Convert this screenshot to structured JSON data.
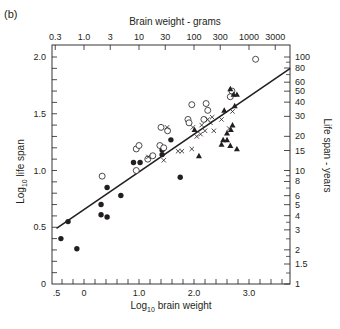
{
  "panel_label": "(b)",
  "chart_data": {
    "type": "scatter",
    "title": "",
    "xlabel": "Log10 brain weight",
    "ylabel": "Log10 life span",
    "x2label": "Brain weight - grams",
    "y2label": "Life span - years",
    "xlim": [
      -0.5,
      3.75
    ],
    "ylim": [
      0,
      2.1
    ],
    "grid": false,
    "legend": "none",
    "x_ticks": [
      {
        "value": -0.5,
        "label": ".5"
      },
      {
        "value": 0,
        "label": "0"
      },
      {
        "value": 1.0,
        "label": "1.0"
      },
      {
        "value": 2.0,
        "label": "2.0"
      },
      {
        "value": 3.0,
        "label": "3.0"
      }
    ],
    "y_ticks": [
      {
        "value": 0,
        "label": "0"
      },
      {
        "value": 0.5,
        "label": "0.5"
      },
      {
        "value": 1.0,
        "label": "1.0"
      },
      {
        "value": 1.5,
        "label": "1.5"
      },
      {
        "value": 2.0,
        "label": "2.0"
      }
    ],
    "top_ticks": [
      {
        "grams": 0.3,
        "label": "0.3"
      },
      {
        "grams": 1.0,
        "label": "1.0"
      },
      {
        "grams": 3,
        "label": "3"
      },
      {
        "grams": 10,
        "label": "10"
      },
      {
        "grams": 30,
        "label": "30"
      },
      {
        "grams": 100,
        "label": "100"
      },
      {
        "grams": 300,
        "label": "300"
      },
      {
        "grams": 1000,
        "label": "1000"
      },
      {
        "grams": 3000,
        "label": "3000"
      }
    ],
    "right_ticks": [
      {
        "years": 100,
        "label": "100"
      },
      {
        "years": 80,
        "label": "80"
      },
      {
        "years": 60,
        "label": "60"
      },
      {
        "years": 50,
        "label": "50"
      },
      {
        "years": 40,
        "label": "40"
      },
      {
        "years": 30,
        "label": "30"
      },
      {
        "years": 20,
        "label": "20"
      },
      {
        "years": 15,
        "label": "15"
      },
      {
        "years": 10,
        "label": "10"
      },
      {
        "years": 8,
        "label": "8"
      },
      {
        "years": 6,
        "label": "6"
      },
      {
        "years": 5,
        "label": "5"
      },
      {
        "years": 4,
        "label": "4"
      },
      {
        "years": 3,
        "label": "3"
      },
      {
        "years": 2,
        "label": "2"
      },
      {
        "years": 1.5,
        "label": "1.5"
      },
      {
        "years": 1,
        "label": "1"
      }
    ],
    "regression_line": {
      "x": [
        -0.5,
        3.75
      ],
      "y": [
        0.49,
        1.9
      ]
    },
    "series": [
      {
        "name": "filled-circle",
        "marker": "filled-circle",
        "points": [
          [
            -0.42,
            0.4
          ],
          [
            -0.29,
            0.55
          ],
          [
            -0.13,
            0.31
          ],
          [
            0.31,
            0.61
          ],
          [
            0.31,
            0.7
          ],
          [
            0.42,
            0.85
          ],
          [
            0.42,
            0.59
          ],
          [
            0.67,
            0.78
          ],
          [
            0.9,
            1.07
          ],
          [
            1.02,
            1.07
          ],
          [
            1.42,
            1.18
          ],
          [
            1.58,
            1.27
          ],
          [
            1.75,
            0.94
          ],
          [
            1.42,
            1.14
          ]
        ]
      },
      {
        "name": "open-circle",
        "marker": "open-circle",
        "points": [
          [
            0.33,
            0.95
          ],
          [
            0.95,
            1.19
          ],
          [
            0.95,
            1.0
          ],
          [
            1.16,
            1.1
          ],
          [
            1.25,
            1.13
          ],
          [
            1.4,
            1.38
          ],
          [
            1.38,
            1.22
          ],
          [
            1.45,
            1.2
          ],
          [
            1.89,
            1.45
          ],
          [
            1.96,
            1.58
          ],
          [
            1.91,
            1.42
          ],
          [
            2.18,
            1.45
          ],
          [
            2.25,
            1.53
          ],
          [
            2.22,
            1.59
          ],
          [
            2.66,
            1.65
          ],
          [
            2.69,
            1.7
          ],
          [
            3.12,
            1.98
          ],
          [
            1.52,
            1.35
          ],
          [
            1.0,
            1.22
          ]
        ]
      },
      {
        "name": "cross",
        "marker": "x",
        "points": [
          [
            1.17,
            1.12
          ],
          [
            1.51,
            1.38
          ],
          [
            1.45,
            1.09
          ],
          [
            1.71,
            1.17
          ],
          [
            1.78,
            1.17
          ],
          [
            1.96,
            1.19
          ],
          [
            1.98,
            1.38
          ],
          [
            2.05,
            1.3
          ],
          [
            2.12,
            1.32
          ],
          [
            2.14,
            1.4
          ],
          [
            2.2,
            1.35
          ],
          [
            2.25,
            1.45
          ],
          [
            2.33,
            1.47
          ],
          [
            2.5,
            1.45
          ],
          [
            2.36,
            1.35
          ],
          [
            2.64,
            1.37
          ],
          [
            2.7,
            1.52
          ],
          [
            2.3,
            1.42
          ]
        ]
      },
      {
        "name": "filled-triangle",
        "marker": "filled-triangle",
        "points": [
          [
            2.01,
            1.36
          ],
          [
            2.09,
            1.13
          ],
          [
            2.66,
            1.72
          ],
          [
            2.72,
            1.67
          ],
          [
            2.78,
            1.67
          ],
          [
            2.74,
            1.57
          ],
          [
            2.6,
            1.33
          ],
          [
            2.67,
            1.36
          ],
          [
            2.7,
            1.4
          ],
          [
            2.66,
            1.22
          ],
          [
            2.78,
            1.19
          ],
          [
            2.53,
            1.27
          ],
          [
            2.5,
            1.23
          ],
          [
            2.6,
            1.27
          ],
          [
            2.55,
            1.53
          ]
        ]
      }
    ]
  }
}
